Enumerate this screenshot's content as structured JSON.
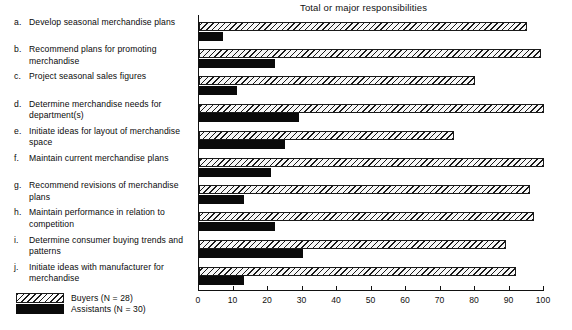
{
  "chart_data": {
    "type": "bar",
    "orientation": "horizontal",
    "title": "Total or major responsibilities",
    "xlabel": "",
    "ylabel": "",
    "xlim": [
      0,
      100
    ],
    "xticks": [
      0,
      10,
      20,
      30,
      40,
      50,
      60,
      70,
      80,
      90,
      100
    ],
    "grid": false,
    "legend_position": "bottom-left",
    "categories": [
      "a. Develop seasonal merchandise plans",
      "b. Recommend plans for promoting merchandise",
      "c. Project seasonal sales figures",
      "d. Determine merchandise needs for department(s)",
      "e. Initiate ideas for layout of merchandise space",
      "f. Maintain current merchandise plans",
      "g. Recommend revisions of merchandise plans",
      "h. Maintain performance in relation to competition",
      "i. Determine consumer buying trends and patterns",
      "j. Initiate ideas with manufacturer for merchandise"
    ],
    "series": [
      {
        "name": "Buyers (N = 28)",
        "fill": "hatched",
        "color": "#1a1a1a",
        "values": [
          95,
          99,
          80,
          100,
          74,
          100,
          96,
          97,
          89,
          92
        ]
      },
      {
        "name": "Assistants (N = 30)",
        "fill": "solid",
        "color": "#0a0a0a",
        "values": [
          7,
          22,
          11,
          29,
          25,
          21,
          13,
          22,
          30,
          13
        ]
      }
    ]
  },
  "items": [
    {
      "key": "a.",
      "text": "Develop seasonal merchandise plans"
    },
    {
      "key": "b.",
      "text": "Recommend plans for promoting merchandise"
    },
    {
      "key": "c.",
      "text": "Project seasonal sales figures"
    },
    {
      "key": "d.",
      "text": "Determine merchandise needs for department(s)"
    },
    {
      "key": "e.",
      "text": "Initiate ideas for layout of merchandise space"
    },
    {
      "key": "f.",
      "text": "Maintain current merchandise plans"
    },
    {
      "key": "g.",
      "text": "Recommend revisions of merchandise plans"
    },
    {
      "key": "h.",
      "text": "Maintain performance in relation to competition"
    },
    {
      "key": "i.",
      "text": "Determine consumer buying trends and patterns"
    },
    {
      "key": "j.",
      "text": "Initiate ideas with manufacturer for merchandise"
    }
  ],
  "legend": {
    "buyers_label": "Buyers (N = 28)",
    "assistants_label": "Assistants (N = 30)"
  }
}
